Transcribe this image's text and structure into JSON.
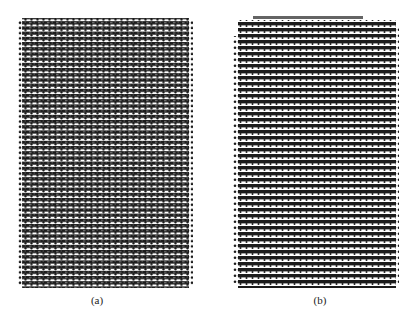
{
  "figure": {
    "panels": [
      {
        "id": "a",
        "label": "(a)",
        "description": "Uniform lattice of dots arranged in dense horizontal rows",
        "dot_color": "#1a1a1a",
        "background": "#ffffff"
      },
      {
        "id": "b",
        "label": "(b)",
        "description": "Lattice of dots in horizontal rows with a disordered, darker region in the middle",
        "dot_color": "#1a1a1a",
        "background": "#ffffff"
      }
    ]
  }
}
